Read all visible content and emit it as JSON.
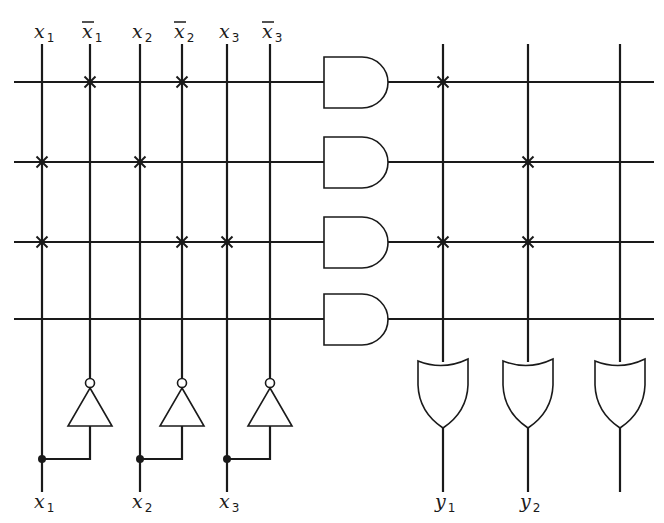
{
  "diagram": {
    "type": "PLA (programmable logic array)",
    "colors": {
      "ink": "#1a1a1a",
      "background": "#ffffff"
    },
    "input_columns": [
      {
        "id": "x1",
        "base": "x",
        "sub": "1",
        "bar": false,
        "x": 42
      },
      {
        "id": "x1n",
        "base": "x",
        "sub": "1",
        "bar": true,
        "x": 90
      },
      {
        "id": "x2",
        "base": "x",
        "sub": "2",
        "bar": false,
        "x": 140
      },
      {
        "id": "x2n",
        "base": "x",
        "sub": "2",
        "bar": true,
        "x": 182
      },
      {
        "id": "x3",
        "base": "x",
        "sub": "3",
        "bar": false,
        "x": 227
      },
      {
        "id": "x3n",
        "base": "x",
        "sub": "3",
        "bar": true,
        "x": 270
      }
    ],
    "bottom_inputs": [
      {
        "base": "x",
        "sub": "1",
        "x": 42
      },
      {
        "base": "x",
        "sub": "2",
        "x": 140
      },
      {
        "base": "x",
        "sub": "3",
        "x": 227
      }
    ],
    "product_rows": [
      {
        "y": 82,
        "and_connections": [
          "x1n",
          "x2n"
        ],
        "or_connections": [
          "y1"
        ]
      },
      {
        "y": 162,
        "and_connections": [
          "x1",
          "x2"
        ],
        "or_connections": [
          "y2"
        ]
      },
      {
        "y": 242,
        "and_connections": [
          "x1",
          "x2n",
          "x3"
        ],
        "or_connections": [
          "y1",
          "y2"
        ]
      },
      {
        "y": 319,
        "and_connections": [],
        "or_connections": []
      }
    ],
    "output_columns": [
      {
        "id": "y1",
        "base": "y",
        "sub": "1",
        "x": 443
      },
      {
        "id": "y2",
        "base": "y",
        "sub": "2",
        "x": 528
      },
      {
        "id": "y3",
        "base": "",
        "sub": "",
        "x": 620
      }
    ],
    "gates": {
      "and_count": 4,
      "or_count": 3,
      "inverter_count": 3
    }
  }
}
